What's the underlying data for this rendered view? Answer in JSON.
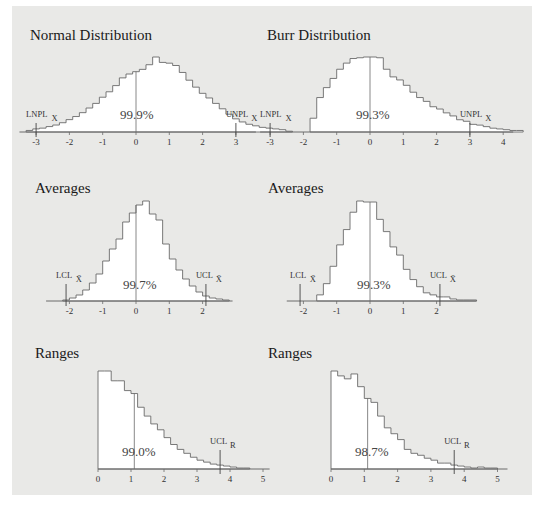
{
  "chart_data": [
    {
      "id": "normal",
      "type": "bar",
      "title": "Normal Distribution",
      "percent_label": "99.9%",
      "xticks": [
        -3,
        -2,
        -1,
        0,
        1,
        2,
        3
      ],
      "limits": [
        {
          "label": "LNPL",
          "sub": "X",
          "x": -3
        },
        {
          "label": "UNPL",
          "sub": "X",
          "x": 3
        }
      ],
      "center_line_x": 0,
      "bin_start": -3.3,
      "bin_width": 0.2,
      "values": [
        2,
        4,
        5,
        7,
        9,
        12,
        16,
        20,
        25,
        31,
        37,
        45,
        52,
        60,
        70,
        75,
        78,
        81,
        87,
        97,
        90,
        89,
        86,
        77,
        67,
        58,
        50,
        44,
        37,
        30,
        23,
        17,
        13,
        10,
        8,
        6,
        5,
        4,
        3,
        1
      ],
      "xrange": [
        -3.5,
        3.6
      ]
    },
    {
      "id": "burr",
      "type": "bar",
      "title": "Burr Distribution",
      "percent_label": "99.3%",
      "xticks": [
        -3,
        -2,
        -1,
        0,
        1,
        2,
        3,
        4
      ],
      "limits": [
        {
          "label": "LNPL",
          "sub": "X",
          "x": -3
        },
        {
          "label": "UNPL",
          "sub": "X",
          "x": 3
        }
      ],
      "center_line_x": 0,
      "bin_start": -1.8,
      "bin_width": 0.2,
      "values": [
        18,
        45,
        58,
        70,
        82,
        90,
        96,
        97,
        98,
        98,
        97,
        82,
        72,
        68,
        61,
        52,
        45,
        40,
        33,
        30,
        25,
        21,
        16,
        14,
        10,
        9,
        7,
        5,
        4,
        3,
        2,
        2
      ],
      "xrange": [
        -3.3,
        4.3
      ]
    },
    {
      "id": "averages-normal",
      "type": "bar",
      "title": "Averages",
      "percent_label": "99.7%",
      "xticks": [
        -2,
        -1,
        0,
        1,
        2
      ],
      "limits": [
        {
          "label": "LCL",
          "sub": "X̄",
          "x": -2.1
        },
        {
          "label": "UCL",
          "sub": "X̄",
          "x": 2.1
        }
      ],
      "center_line_x": 0,
      "bin_start": -2.2,
      "bin_width": 0.2,
      "values": [
        1,
        3,
        6,
        11,
        18,
        27,
        40,
        52,
        62,
        79,
        88,
        96,
        100,
        87,
        81,
        57,
        42,
        31,
        22,
        15,
        9,
        5,
        3,
        2,
        1
      ],
      "xrange": [
        -2.7,
        2.9
      ]
    },
    {
      "id": "averages-burr",
      "type": "bar",
      "title": "Averages",
      "percent_label": "99.3%",
      "xticks": [
        -2,
        -1,
        0,
        1,
        2
      ],
      "limits": [
        {
          "label": "LCL",
          "sub": "X̄",
          "x": -2.1
        },
        {
          "label": "UCL",
          "sub": "X̄",
          "x": 2.1
        }
      ],
      "center_line_x": 0,
      "bin_start": -1.6,
      "bin_width": 0.2,
      "values": [
        6,
        17,
        34,
        55,
        70,
        87,
        98,
        97,
        97,
        80,
        68,
        53,
        45,
        31,
        21,
        14,
        8,
        6,
        4,
        4,
        2,
        1,
        1,
        1
      ],
      "xrange": [
        -2.5,
        3.2
      ]
    },
    {
      "id": "ranges-normal",
      "type": "bar",
      "title": "Ranges",
      "percent_label": "99.0%",
      "xticks": [
        0,
        1,
        2,
        3,
        4,
        5
      ],
      "limits": [
        {
          "label": "UCL",
          "sub": "R",
          "x": 3.7
        }
      ],
      "center_line_x": 1.1,
      "bin_start": 0,
      "bin_width": 0.2,
      "values": [
        100,
        100,
        90,
        90,
        80,
        77,
        63,
        54,
        46,
        40,
        32,
        25,
        20,
        16,
        12,
        9,
        7,
        5,
        4,
        3,
        2,
        1,
        1
      ],
      "xrange": [
        0,
        5.2
      ]
    },
    {
      "id": "ranges-burr",
      "type": "bar",
      "title": "Ranges",
      "percent_label": "98.7%",
      "xticks": [
        0,
        1,
        2,
        3,
        4,
        5
      ],
      "limits": [
        {
          "label": "UCL",
          "sub": "R",
          "x": 3.7
        }
      ],
      "center_line_x": 1.1,
      "bin_start": 0,
      "bin_width": 0.2,
      "values": [
        100,
        95,
        92,
        97,
        84,
        72,
        68,
        54,
        42,
        36,
        30,
        20,
        16,
        14,
        11,
        9,
        6,
        6,
        4,
        3,
        2,
        1,
        2,
        1,
        1
      ],
      "xrange": [
        0,
        5.3
      ]
    }
  ],
  "layout": {
    "fill_color": "#ffffff",
    "line_color": "#6a6a6a",
    "panel_color": "#e9e9e7"
  }
}
